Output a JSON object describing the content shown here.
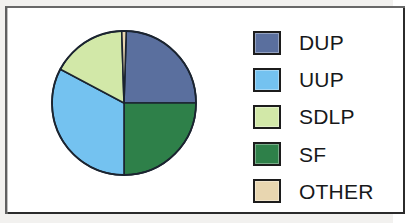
{
  "chart_data": {
    "type": "pie",
    "title": "",
    "subtitle": "",
    "xlabel": "",
    "ylabel": "",
    "legend_position": "right",
    "grid": false,
    "start_angle_deg": 0,
    "direction": "clockwise",
    "categories": [
      "DUP",
      "UUP",
      "SDLP",
      "SF",
      "OTHER"
    ],
    "values": [
      24.5,
      32.8,
      16.7,
      25.5,
      0.5
    ],
    "unit": "percent",
    "slices": [
      {
        "label": "DUP",
        "value": 24.5,
        "color": "#5a6f9e",
        "start_deg": 1.8,
        "end_deg": 90.0
      },
      {
        "label": "SF",
        "value": 25.5,
        "color": "#2e8049",
        "start_deg": 90.0,
        "end_deg": 180.0
      },
      {
        "label": "UUP",
        "value": 32.8,
        "color": "#74c2f0",
        "start_deg": 180.0,
        "end_deg": 298.0
      },
      {
        "label": "SDLP",
        "value": 16.7,
        "color": "#d2e8a8",
        "start_deg": 298.0,
        "end_deg": 358.2
      },
      {
        "label": "OTHER",
        "value": 0.5,
        "color": "#e8d6b0",
        "start_deg": 358.2,
        "end_deg": 361.8
      }
    ],
    "geometry": {
      "center_x": 74,
      "center_y": 74,
      "radius": 72
    },
    "stroke_color": "#1b2430",
    "stroke_width": 1.6
  },
  "legend": {
    "items": [
      {
        "label": "DUP",
        "color": "#5a6f9e"
      },
      {
        "label": "UUP",
        "color": "#74c2f0"
      },
      {
        "label": "SDLP",
        "color": "#d2e8a8"
      },
      {
        "label": "SF",
        "color": "#2e8049"
      },
      {
        "label": "OTHER",
        "color": "#e8d6b0"
      }
    ]
  },
  "frame": {
    "border_color": "#2b2b2b",
    "background": "#ffffff",
    "page_background": "#f2f1ef"
  }
}
